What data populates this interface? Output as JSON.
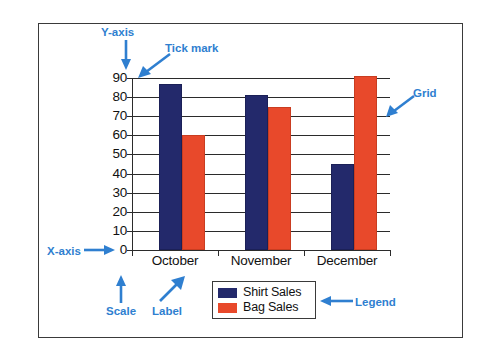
{
  "chart_data": {
    "type": "bar",
    "title": "",
    "subtitle": "",
    "xlabel": "",
    "ylabel": "",
    "categories": [
      "October",
      "November",
      "December"
    ],
    "series": [
      {
        "name": "Shirt Sales",
        "color": "#23296b",
        "values": [
          87,
          81,
          45
        ]
      },
      {
        "name": "Bag Sales",
        "color": "#e8492b",
        "values": [
          60,
          75,
          91
        ]
      }
    ],
    "ylim": [
      0,
      90
    ],
    "ytick_step": 10,
    "ytick_labels": [
      "90",
      "80",
      "70",
      "60",
      "50",
      "40",
      "30",
      "20",
      "10",
      "0"
    ],
    "grid": "horizontal",
    "legend_position": "bottom-center",
    "annotations": [
      {
        "id": "y-axis",
        "text": "Y-axis",
        "arrow": "down"
      },
      {
        "id": "tick-mark",
        "text": "Tick mark",
        "arrow": "down-left"
      },
      {
        "id": "grid",
        "text": "Grid",
        "arrow": "down-left"
      },
      {
        "id": "x-axis",
        "text": "X-axis",
        "arrow": "right"
      },
      {
        "id": "scale",
        "text": "Scale",
        "arrow": "up"
      },
      {
        "id": "label",
        "text": "Label",
        "arrow": "up-right"
      },
      {
        "id": "legend",
        "text": "Legend",
        "arrow": "left"
      }
    ]
  },
  "colors": {
    "annotation": "#2f7fd0",
    "frame": "#3a3a3a",
    "axis": "#2b2b2b",
    "shirt": "#23296b",
    "bag": "#e8492b",
    "background": "#ffffff"
  },
  "annotations": {
    "y_axis": "Y-axis",
    "tick_mark": "Tick mark",
    "grid": "Grid",
    "x_axis": "X-axis",
    "scale": "Scale",
    "label": "Label",
    "legend": "Legend"
  },
  "legend": {
    "items": [
      {
        "label": "Shirt Sales",
        "color": "#23296b"
      },
      {
        "label": "Bag Sales",
        "color": "#e8492b"
      }
    ]
  },
  "axis": {
    "y_ticks": [
      "90",
      "80",
      "70",
      "60",
      "50",
      "40",
      "30",
      "20",
      "10",
      "0"
    ],
    "x_categories": [
      "October",
      "November",
      "December"
    ]
  }
}
